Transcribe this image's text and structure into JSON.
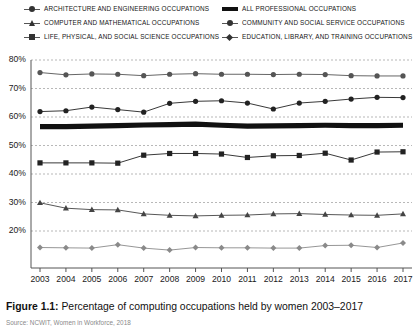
{
  "figure": {
    "caption_label": "Figure 1.1:",
    "caption_text": "Percentage of computing occupations held by women 2003–2017",
    "source": "Source: NCWIT, Women in Workforce, 2018"
  },
  "legend": {
    "left_column": [
      {
        "label": "ARCHITECTURE AND ENGINEERING OCCUPATIONS",
        "marker": "circle",
        "color": "#555555",
        "series_key": "architecture"
      },
      {
        "label": "COMPUTER AND MATHEMATICAL OCCUPATIONS",
        "marker": "triangle",
        "color": "#444444",
        "series_key": "computer"
      },
      {
        "label": "LIFE, PHYSICAL, AND SOCIAL SCIENCE OCCUPATIONS",
        "marker": "square",
        "color": "#222222",
        "series_key": "life_science"
      }
    ],
    "right_column": [
      {
        "label": "ALL PROFESSIONAL OCCUPATIONS",
        "marker": "thick-line",
        "color": "#111111",
        "series_key": "all_professional"
      },
      {
        "label": "COMMUNITY AND SOCIAL SERVICE OCCUPATIONS",
        "marker": "circle",
        "color": "#222222",
        "series_key": "community"
      },
      {
        "label": "EDUCATION, LIBRARY, AND TRAINING OCCUPATIONS",
        "marker": "diamond",
        "color": "#888888",
        "series_key": "education"
      }
    ]
  },
  "axes": {
    "y_ticks": [
      "80%",
      "70%",
      "60%",
      "50%",
      "40%",
      "30%",
      "20%"
    ],
    "x_ticks": [
      "2003",
      "2004",
      "2005",
      "2006",
      "2007",
      "2008",
      "2009",
      "2010",
      "2011",
      "2012",
      "2013",
      "2014",
      "2015",
      "2016",
      "2017"
    ]
  },
  "chart_data": {
    "type": "line",
    "title": "Percentage of computing occupations held by women 2003–2017",
    "xlabel": "",
    "ylabel": "",
    "ylim": [
      15,
      82
    ],
    "xlim": [
      2003,
      2017
    ],
    "grid": true,
    "legend_position": "top",
    "x": [
      2003,
      2004,
      2005,
      2006,
      2007,
      2008,
      2009,
      2010,
      2011,
      2012,
      2013,
      2014,
      2015,
      2016,
      2017
    ],
    "series": [
      {
        "name": "EDUCATION, LIBRARY, AND TRAINING OCCUPATIONS",
        "marker": "diamond",
        "color": "#8a8a8a",
        "values": [
          14.2,
          14.1,
          14.0,
          15.2,
          14.0,
          13.3,
          14.2,
          14.1,
          14.1,
          14.0,
          14.0,
          14.9,
          15.0,
          14.2,
          15.8
        ]
      },
      {
        "name": "COMPUTER AND MATHEMATICAL OCCUPATIONS",
        "marker": "triangle",
        "color": "#444444",
        "values": [
          29.9,
          28.0,
          27.5,
          27.4,
          26.0,
          25.5,
          25.3,
          25.5,
          25.6,
          26.0,
          26.1,
          25.8,
          25.6,
          25.5,
          26.0
        ]
      },
      {
        "name": "LIFE, PHYSICAL, AND SOCIAL SCIENCE OCCUPATIONS",
        "marker": "square",
        "color": "#222222",
        "values": [
          43.9,
          43.9,
          43.9,
          43.8,
          46.6,
          47.2,
          47.2,
          47.0,
          45.8,
          46.4,
          46.5,
          47.3,
          44.9,
          47.7,
          47.8
        ]
      },
      {
        "name": "ALL PROFESSIONAL OCCUPATIONS",
        "marker": "thick-line",
        "color": "#111111",
        "values": [
          56.6,
          56.6,
          56.8,
          57.0,
          57.2,
          57.3,
          57.5,
          57.1,
          56.8,
          56.9,
          57.0,
          57.1,
          57.0,
          57.0,
          57.1
        ]
      },
      {
        "name": "COMMUNITY AND SOCIAL SERVICE OCCUPATIONS",
        "marker": "circle",
        "color": "#222222",
        "values": [
          61.9,
          62.2,
          63.5,
          62.6,
          61.7,
          64.8,
          65.5,
          65.7,
          64.9,
          62.8,
          64.9,
          65.5,
          66.3,
          66.9,
          66.8
        ]
      },
      {
        "name": "ARCHITECTURE AND ENGINEERING OCCUPATIONS",
        "marker": "circle",
        "color": "#555555",
        "values": [
          75.6,
          74.8,
          75.1,
          75.0,
          74.5,
          75.0,
          75.2,
          75.0,
          75.0,
          74.9,
          75.0,
          74.9,
          74.5,
          74.4,
          74.4
        ]
      }
    ]
  }
}
